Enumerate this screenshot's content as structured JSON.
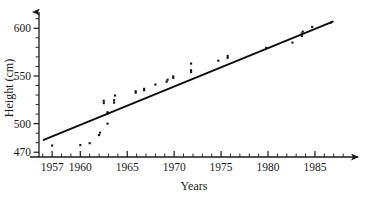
{
  "chart_data": {
    "type": "scatter",
    "title": "",
    "xlabel": "Years",
    "ylabel": "Height (cm)",
    "xlim": [
      1955.6,
      1988.2
    ],
    "ylim": [
      465,
      615
    ],
    "grid": false,
    "legend": "none",
    "x_ticks_major": [
      1957,
      1960,
      1965,
      1970,
      1975,
      1980,
      1985
    ],
    "x_tick_labels": [
      "1957",
      "1960",
      "1965",
      "1970",
      "1975",
      "1980",
      "1985"
    ],
    "x_minor_step": 1,
    "y_ticks_major": [
      470,
      500,
      550,
      600
    ],
    "y_tick_labels": [
      "470",
      "500",
      "550",
      "600"
    ],
    "y_minor_step": 10,
    "points": [
      {
        "x": 1957.0,
        "y": 477.0
      },
      {
        "x": 1960.0,
        "y": 477.5
      },
      {
        "x": 1961.0,
        "y": 479.5
      },
      {
        "x": 1962.0,
        "y": 488.0
      },
      {
        "x": 1962.1,
        "y": 490.5
      },
      {
        "x": 1962.9,
        "y": 500.0
      },
      {
        "x": 1962.9,
        "y": 510.5
      },
      {
        "x": 1962.9,
        "y": 512.0
      },
      {
        "x": 1962.5,
        "y": 521.5
      },
      {
        "x": 1962.5,
        "y": 524.0
      },
      {
        "x": 1963.6,
        "y": 522.0
      },
      {
        "x": 1963.6,
        "y": 524.5
      },
      {
        "x": 1963.7,
        "y": 529.5
      },
      {
        "x": 1965.9,
        "y": 532.5
      },
      {
        "x": 1965.9,
        "y": 534.0
      },
      {
        "x": 1966.8,
        "y": 535.0
      },
      {
        "x": 1966.8,
        "y": 536.5
      },
      {
        "x": 1968.0,
        "y": 541.0
      },
      {
        "x": 1969.2,
        "y": 544.0
      },
      {
        "x": 1969.3,
        "y": 546.0
      },
      {
        "x": 1969.9,
        "y": 548.0
      },
      {
        "x": 1969.9,
        "y": 549.5
      },
      {
        "x": 1971.8,
        "y": 554.0
      },
      {
        "x": 1971.8,
        "y": 556.0
      },
      {
        "x": 1971.8,
        "y": 563.0
      },
      {
        "x": 1974.7,
        "y": 566.0
      },
      {
        "x": 1975.7,
        "y": 569.0
      },
      {
        "x": 1975.7,
        "y": 571.0
      },
      {
        "x": 1979.8,
        "y": 579.5
      },
      {
        "x": 1982.6,
        "y": 585.0
      },
      {
        "x": 1983.6,
        "y": 592.0
      },
      {
        "x": 1983.6,
        "y": 594.5
      },
      {
        "x": 1983.7,
        "y": 596.5
      },
      {
        "x": 1984.7,
        "y": 601.5
      },
      {
        "x": 1986.7,
        "y": 606.0
      }
    ],
    "fit_line": {
      "label": "least-squares line",
      "x0": 1956.1,
      "y0": 483.0,
      "x1": 1986.9,
      "y1": 607.0
    },
    "colors": {
      "axis": "#1a1a1a",
      "point": "#111111",
      "line": "#0d0d0d",
      "background": "#ffffff"
    }
  }
}
